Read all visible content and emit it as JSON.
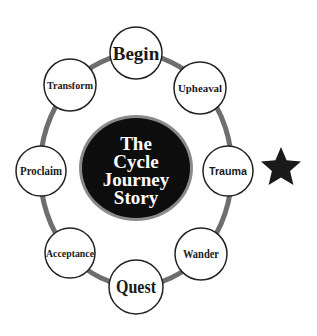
{
  "diagram": {
    "title_lines": [
      "The",
      "Cycle",
      "Journey",
      "Story"
    ],
    "colors": {
      "ring": "#6e6e6e",
      "node_fill": "#ffffff",
      "node_stroke": "#222222",
      "center_fill": "#0d0d0d",
      "center_ring": "#8a8a8a",
      "center_text": "#ffffff",
      "star": "#1a1a1a"
    },
    "nodes": [
      {
        "label": "Begin",
        "cx": 136,
        "cy": 53,
        "r": 26,
        "size": 19
      },
      {
        "label": "Upheaval",
        "cx": 200,
        "cy": 88,
        "r": 26,
        "size": 11
      },
      {
        "label": "Trauma",
        "cx": 228,
        "cy": 171,
        "r": 25,
        "size": 11
      },
      {
        "label": "Wander",
        "cx": 201,
        "cy": 254,
        "r": 26,
        "size": 12
      },
      {
        "label": "Quest",
        "cx": 136,
        "cy": 287,
        "r": 27,
        "size": 19
      },
      {
        "label": "Acceptance",
        "cx": 70,
        "cy": 253,
        "r": 25,
        "size": 10
      },
      {
        "label": "Proclaim",
        "cx": 41,
        "cy": 171,
        "r": 25,
        "size": 12
      },
      {
        "label": "Transform",
        "cx": 70,
        "cy": 85,
        "r": 26,
        "size": 11
      }
    ],
    "marker": {
      "symbol": "star",
      "label": "★",
      "target": "Trauma"
    }
  }
}
